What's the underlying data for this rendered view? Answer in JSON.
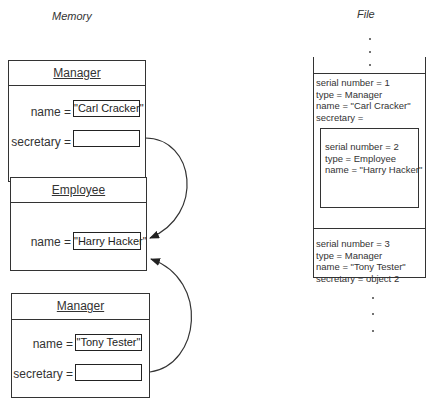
{
  "memory": {
    "title": "Memory",
    "objects": [
      {
        "class_name": "Manager",
        "fields": [
          {
            "label": "name =",
            "value": "\"Carl Cracker\""
          },
          {
            "label": "secretary =",
            "value": ""
          }
        ]
      },
      {
        "class_name": "Employee",
        "fields": [
          {
            "label": "name =",
            "value": "\"Harry Hacker\""
          }
        ]
      },
      {
        "class_name": "Manager",
        "fields": [
          {
            "label": "name =",
            "value": "\"Tony Tester\""
          },
          {
            "label": "secretary =",
            "value": ""
          }
        ]
      }
    ],
    "references": [
      {
        "from": "Manager (Carl Cracker).secretary",
        "to": "Employee (Harry Hacker)"
      },
      {
        "from": "Manager (Tony Tester).secretary",
        "to": "Employee (Harry Hacker)"
      }
    ]
  },
  "file": {
    "title": "File",
    "records": [
      {
        "lines": [
          "serial number = 1",
          "type = Manager",
          "name = \"Carl Cracker\"",
          "secretary ="
        ],
        "nested": {
          "lines": [
            "serial number = 2",
            "type = Employee",
            "name = \"Harry Hacker\""
          ]
        }
      },
      {
        "lines": [
          "serial number = 3",
          "type = Manager",
          "name = \"Tony Tester\"",
          "secretary = object 2"
        ]
      }
    ],
    "ellipsis": "⋮"
  },
  "colors": {
    "line": "#333333",
    "background": "#ffffff"
  }
}
